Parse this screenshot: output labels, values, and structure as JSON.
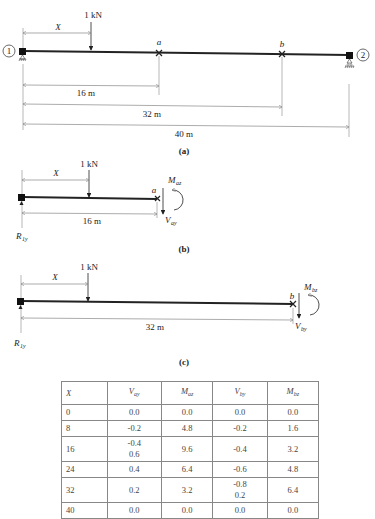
{
  "figure_a": {
    "caption": "(a)",
    "node_left": "1",
    "node_right": "2",
    "load_label": "1 kN",
    "x_label": "X",
    "point_a": "a",
    "point_b": "b",
    "dim_16": "16 m",
    "dim_32": "32 m",
    "dim_40": "40 m"
  },
  "figure_b": {
    "caption": "(b)",
    "load_label": "1 kN",
    "x_label": "X",
    "point_a": "a",
    "dim": "16 m",
    "moment": "M",
    "moment_sub": "az",
    "shear": "V",
    "shear_sub": "ay",
    "reaction": "R",
    "reaction_sub": "1y"
  },
  "figure_c": {
    "caption": "(c)",
    "load_label": "1 kN",
    "x_label": "X",
    "point_b": "b",
    "dim": "32 m",
    "moment": "M",
    "moment_sub": "bz",
    "shear": "V",
    "shear_sub": "by",
    "reaction": "R",
    "reaction_sub": "1y"
  },
  "table": {
    "headers": [
      {
        "main": "X",
        "sub": ""
      },
      {
        "main": "V",
        "sub": "ay"
      },
      {
        "main": "M",
        "sub": "az"
      },
      {
        "main": "V",
        "sub": "by"
      },
      {
        "main": "M",
        "sub": "bz"
      }
    ],
    "rows": [
      {
        "x": "0",
        "vay": "0.0",
        "vay2": "",
        "maz": "0.0",
        "vby": "0.0",
        "vby2": "",
        "mbz": "0.0"
      },
      {
        "x": "8",
        "vay": "-0.2",
        "vay2": "",
        "maz": "4.8",
        "vby": "-0.2",
        "vby2": "",
        "mbz": "1.6"
      },
      {
        "x": "16",
        "vay": "-0.4",
        "vay2": "0.6",
        "maz": "9.6",
        "vby": "-0.4",
        "vby2": "",
        "mbz": "3.2"
      },
      {
        "x": "24",
        "vay": "0.4",
        "vay2": "",
        "maz": "6.4",
        "vby": "-0.6",
        "vby2": "",
        "mbz": "4.8"
      },
      {
        "x": "32",
        "vay": "0.2",
        "vay2": "",
        "maz": "3.2",
        "vby": "-0.8",
        "vby2": "0.2",
        "mbz": "6.4"
      },
      {
        "x": "40",
        "vay": "0.0",
        "vay2": "",
        "maz": "0.0",
        "vby": "0.0",
        "vby2": "",
        "mbz": "0.0"
      }
    ]
  }
}
